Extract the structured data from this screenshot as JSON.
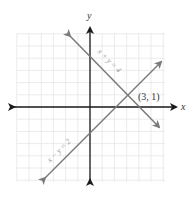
{
  "chart_data": {
    "type": "line",
    "title": "",
    "xlabel": "x",
    "ylabel": "y",
    "xlim": [
      -6.5,
      6.5
    ],
    "ylim": [
      -6.5,
      6.5
    ],
    "grid": true,
    "series": [
      {
        "name": "x + y = 4",
        "equation": "x + y = 4",
        "x": [
          -2,
          6
        ],
        "y": [
          6,
          -2
        ],
        "color": "#7a7a7a"
      },
      {
        "name": "x − y = 2",
        "equation": "x − y = 2",
        "x": [
          -4,
          6
        ],
        "y": [
          -6,
          4
        ],
        "color": "#7a7a7a"
      }
    ],
    "annotations": [
      {
        "text": "(3, 1)",
        "x": 3,
        "y": 1
      }
    ]
  },
  "labels": {
    "x_axis": "x",
    "y_axis": "y",
    "line1": "x + y = 4",
    "line2": "x − y = 2",
    "point": "(3, 1)"
  },
  "colors": {
    "grid": "#e6e6e6",
    "axis": "#1a1a1a",
    "line": "#7a7a7a",
    "text": "#333333",
    "line_label": "#9a9a9a"
  }
}
